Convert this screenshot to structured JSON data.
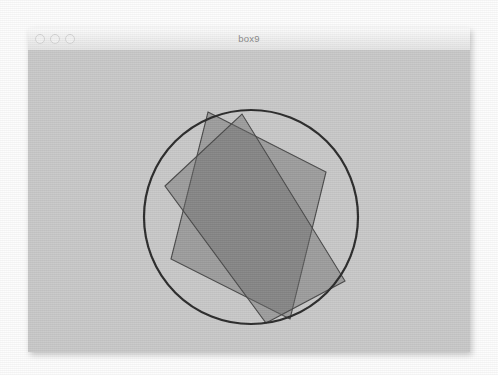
{
  "window": {
    "title": "box9",
    "traffic_lights": [
      {
        "name": "close-button",
        "color": "#f2f2f2"
      },
      {
        "name": "minimize-button",
        "color": "#f2f2f2"
      },
      {
        "name": "zoom-button",
        "color": "#f2f2f2"
      }
    ]
  },
  "canvas": {
    "background_color": "#c9c9c9",
    "stroke_color": "#2b2b2b",
    "shape_fill": "#6a6a6a",
    "shape_fill_opacity": 0.45,
    "shape_stroke": "#4a4a4a"
  },
  "figure": {
    "circle": {
      "name": "bounding-circle",
      "cx": 223,
      "cy": 167,
      "r": 107,
      "stroke_width": 2.2
    },
    "rectangles": [
      {
        "name": "rectangle-a",
        "points": "180,62 298,122 262,269 143,209"
      },
      {
        "name": "rectangle-b",
        "points": "137,136 214,64 317,231 238,273"
      }
    ]
  }
}
